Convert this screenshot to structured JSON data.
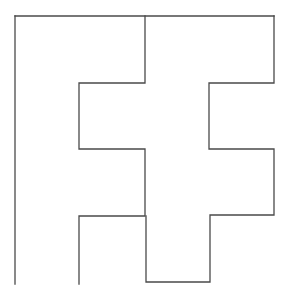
{
  "diagram": {
    "stroke_color": "#4a4a4a",
    "background_color": "#ffffff",
    "pieces": [
      {
        "name": "left-F-piece"
      },
      {
        "name": "right-F-piece"
      }
    ]
  }
}
